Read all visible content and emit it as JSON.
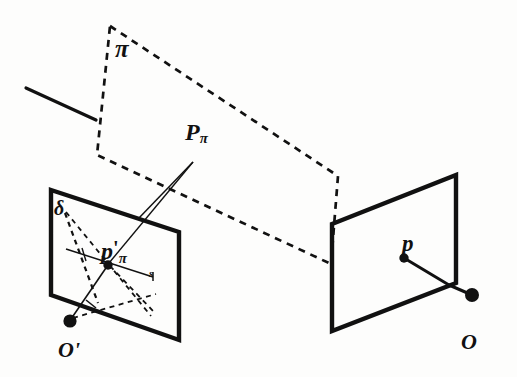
{
  "figure": {
    "background_color": "#fdfdfc",
    "ink_color": "#111111",
    "labels": {
      "plane_pi": "π",
      "point_P_pi_base": "P",
      "point_P_pi_sub": "π",
      "line_delta": "δ",
      "point_p_pi_prime_base": "p",
      "point_p_pi_prime_prime": "'",
      "point_p_pi_prime_sub": "π",
      "line_s": "s",
      "center_O_prime": "O'",
      "point_p": "p",
      "center_O": "O"
    },
    "geometry": {
      "left_plane": {
        "name": "left-image-plane",
        "points": "51,190 179,232 179,340 51,295",
        "stroke_width": 4.2
      },
      "right_plane": {
        "name": "right-image-plane",
        "points": "332,224 456,175 456,283 332,331",
        "stroke_width": 4.2
      },
      "pi_plane_dashed": {
        "name": "scene-plane-pi",
        "points": "110,26 338,176 331,264 97,155",
        "dash": "7,6",
        "stroke_width": 2.6
      },
      "ray_Ppi_to_left_plane": {
        "from": "193,162",
        "to": "139,218"
      },
      "ray_Ppi_to_ppi_prime": {
        "from": "193,162",
        "to": "108,262"
      },
      "solid_stub_upper_left": {
        "from": "26,88",
        "to": "96,120"
      },
      "line_s_segment": {
        "from": "67,250",
        "to": "152,277"
      },
      "dot_O_prime": {
        "cx": 70,
        "cy": 321,
        "r": 6.5
      },
      "dot_p_pi_prime": {
        "cx": 108,
        "cy": 265,
        "r": 4.6
      },
      "dot_p": {
        "cx": 404,
        "cy": 258,
        "r": 4.6
      },
      "dot_O": {
        "cx": 472,
        "cy": 295,
        "r": 6.8
      },
      "ray_p_to_O": "404,258 449,285 472,295"
    }
  }
}
